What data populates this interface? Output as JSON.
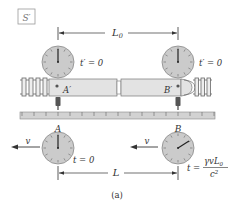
{
  "frame_label": "S′",
  "proper_length_label": "L",
  "proper_length_subscript": "0",
  "contracted_length_label": "L",
  "train_clocks": [
    {
      "name": "A′",
      "reading": "t′ = 0"
    },
    {
      "name": "B′",
      "reading": "t′ = 0"
    }
  ],
  "ground_clocks": [
    {
      "name": "A",
      "reading": "t = 0"
    },
    {
      "name": "B",
      "reading_prefix": "t =",
      "numerator": "γvL",
      "numerator_subscript": "0",
      "denominator": "c",
      "denominator_superscript": "2"
    }
  ],
  "velocity_label": "v",
  "caption": "(a)",
  "colors": {
    "clock_face": "#c9c9c9",
    "clock_rim": "#8a8a8a",
    "train_body": "#e2e2e2",
    "train_outline": "#6a6a6a",
    "ruler": "#cfcfcf",
    "ink": "#333333",
    "sensor": "#555555"
  }
}
